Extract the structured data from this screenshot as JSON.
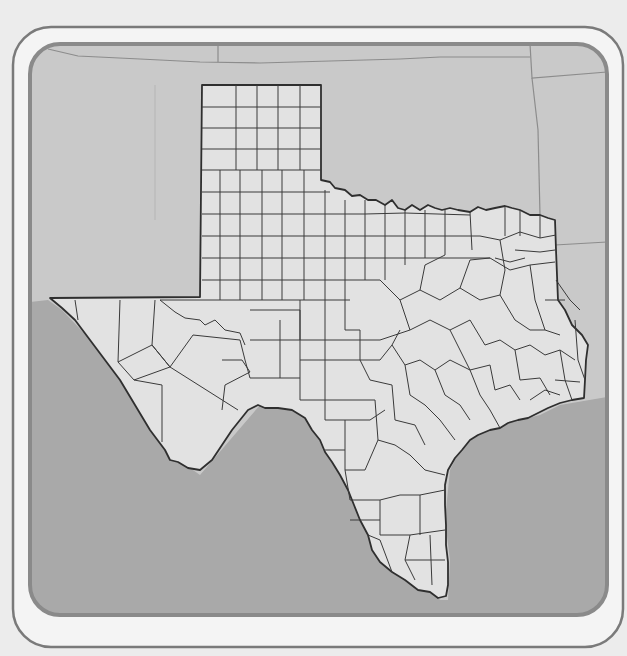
{
  "map": {
    "subject": "Texas county outline map",
    "labels": [],
    "colors": {
      "page_background": "#ececec",
      "frame_stroke": "#7a7a7a",
      "frame_fill": "#f4f4f4",
      "panel_border": "#8a8a8a",
      "neighbor_land": "#c9c9c9",
      "water": "#a9a9a9",
      "texas_fill": "#e2e2e2",
      "county_lines": "#3a3a3a",
      "state_lines": "#8c8c8c"
    },
    "regions": [
      {
        "name": "texas",
        "role": "focus state"
      },
      {
        "name": "new-mexico",
        "role": "neighbor"
      },
      {
        "name": "oklahoma",
        "role": "neighbor"
      },
      {
        "name": "arkansas",
        "role": "neighbor"
      },
      {
        "name": "louisiana",
        "role": "neighbor"
      },
      {
        "name": "colorado",
        "role": "neighbor"
      },
      {
        "name": "kansas",
        "role": "neighbor"
      },
      {
        "name": "mexico",
        "role": "water-toned area"
      },
      {
        "name": "gulf-of-mexico",
        "role": "water"
      }
    ]
  }
}
